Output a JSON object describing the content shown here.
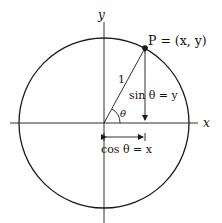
{
  "diagram": {
    "axes": {
      "x_label": "x",
      "y_label": "y"
    },
    "point": {
      "label": "P = (x, y)"
    },
    "radius_label": "1",
    "angle_label": "θ",
    "sin_label": "sin θ = y",
    "cos_label": "cos θ = x",
    "colors": {
      "stroke": "#1a1a1a",
      "background": "#ffffff"
    }
  }
}
